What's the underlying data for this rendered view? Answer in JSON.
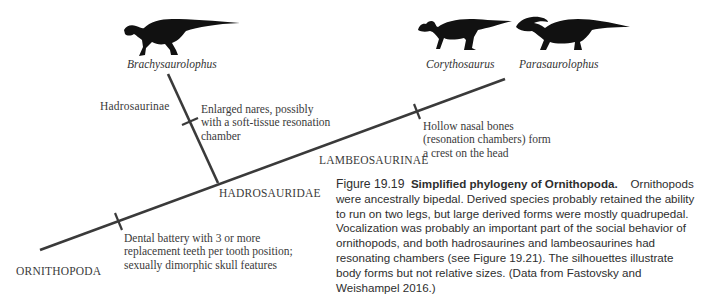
{
  "genera": {
    "brachy": "Brachysaurolophus",
    "corytho": "Corythosaurus",
    "para": "Parasaurolophus"
  },
  "clades": {
    "ornithopoda": "ORNITHOPODA",
    "hadrosauridae": "HADROSAURIDAE",
    "lambeosaurinae": "LAMBEOSAURINAE",
    "hadrosaurinae": "Hadrosaurinae"
  },
  "traits": {
    "dental": "Dental battery with 3 or more replacement teeth per tooth position; sexually dimorphic skull features",
    "nares": "Enlarged nares, possibly with a soft-tissue resonation chamber",
    "nasal": "Hollow nasal bones (resonation chambers) form a crest on the head"
  },
  "caption": {
    "number": "Figure 19.19",
    "title": "Simplified phylogeny of Ornithopoda.",
    "body": "Ornithopods were ancestrally bipedal. Derived species probably retained the ability to run on two legs, but large derived forms were mostly quadrupedal. Vocalization was probably an important part of the social behavior of ornithopods, and both hadrosaurines and lambeosaurines had resonating chambers (see Figure 19.21). The silhouettes illustrate body forms but not relative sizes. (Data from Fastovsky and Weishampel 2016.)"
  },
  "colors": {
    "line": "#3a3a3a",
    "silhouette": "#111111",
    "text": "#3a3a3a"
  }
}
